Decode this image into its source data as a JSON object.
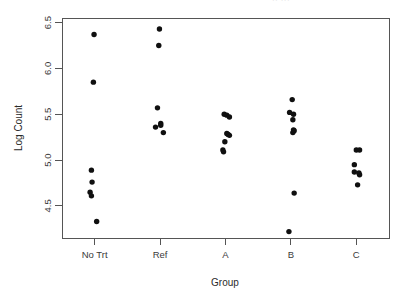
{
  "chart_data": {
    "type": "scatter",
    "title": "",
    "xlabel": "Group",
    "ylabel": "Log Count",
    "categories": [
      "No Trt",
      "Ref",
      "A",
      "B",
      "C"
    ],
    "ylim": [
      4.15,
      6.55
    ],
    "yticks": [
      4.5,
      5.0,
      5.5,
      6.0,
      6.5
    ],
    "ytick_labels": [
      "4.5",
      "5.0",
      "5.5",
      "6.0",
      "6.5"
    ],
    "grid": false,
    "legend": "none",
    "point_color": "#101010",
    "axis_color": "#555555",
    "series": [
      {
        "name": "No Trt",
        "category_index": 0,
        "points": [
          {
            "jitter": -0.01,
            "value": 6.37
          },
          {
            "jitter": -0.02,
            "value": 5.85
          },
          {
            "jitter": -0.05,
            "value": 4.89
          },
          {
            "jitter": -0.04,
            "value": 4.76
          },
          {
            "jitter": -0.07,
            "value": 4.65
          },
          {
            "jitter": -0.05,
            "value": 4.61
          },
          {
            "jitter": 0.03,
            "value": 4.33
          }
        ]
      },
      {
        "name": "Ref",
        "category_index": 1,
        "points": [
          {
            "jitter": -0.01,
            "value": 6.43
          },
          {
            "jitter": -0.02,
            "value": 6.25
          },
          {
            "jitter": -0.04,
            "value": 5.57
          },
          {
            "jitter": -0.07,
            "value": 5.36
          },
          {
            "jitter": 0.01,
            "value": 5.4
          },
          {
            "jitter": 0.01,
            "value": 5.38
          },
          {
            "jitter": 0.05,
            "value": 5.3
          }
        ]
      },
      {
        "name": "A",
        "category_index": 2,
        "points": [
          {
            "jitter": -0.02,
            "value": 5.5
          },
          {
            "jitter": 0.02,
            "value": 5.49
          },
          {
            "jitter": 0.06,
            "value": 5.47
          },
          {
            "jitter": 0.02,
            "value": 5.29
          },
          {
            "jitter": 0.04,
            "value": 5.28
          },
          {
            "jitter": 0.06,
            "value": 5.27
          },
          {
            "jitter": -0.01,
            "value": 5.2
          },
          {
            "jitter": -0.04,
            "value": 5.11
          },
          {
            "jitter": -0.03,
            "value": 5.09
          }
        ]
      },
      {
        "name": "B",
        "category_index": 3,
        "points": [
          {
            "jitter": 0.02,
            "value": 5.66
          },
          {
            "jitter": -0.02,
            "value": 5.52
          },
          {
            "jitter": 0.04,
            "value": 5.5
          },
          {
            "jitter": 0.03,
            "value": 5.44
          },
          {
            "jitter": 0.04,
            "value": 5.33
          },
          {
            "jitter": 0.05,
            "value": 5.32
          },
          {
            "jitter": 0.03,
            "value": 5.3
          },
          {
            "jitter": 0.05,
            "value": 4.64
          },
          {
            "jitter": -0.03,
            "value": 4.22
          }
        ]
      },
      {
        "name": "C",
        "category_index": 4,
        "points": [
          {
            "jitter": 0.0,
            "value": 5.11
          },
          {
            "jitter": 0.05,
            "value": 5.11
          },
          {
            "jitter": -0.03,
            "value": 4.95
          },
          {
            "jitter": -0.03,
            "value": 4.87
          },
          {
            "jitter": 0.04,
            "value": 4.86
          },
          {
            "jitter": 0.05,
            "value": 4.84
          },
          {
            "jitter": 0.02,
            "value": 4.73
          }
        ]
      }
    ]
  },
  "axes": {
    "y_title": "Log Count",
    "x_title": "Group"
  },
  "artifacts": {
    "clipped_top_text": "·· ···"
  }
}
